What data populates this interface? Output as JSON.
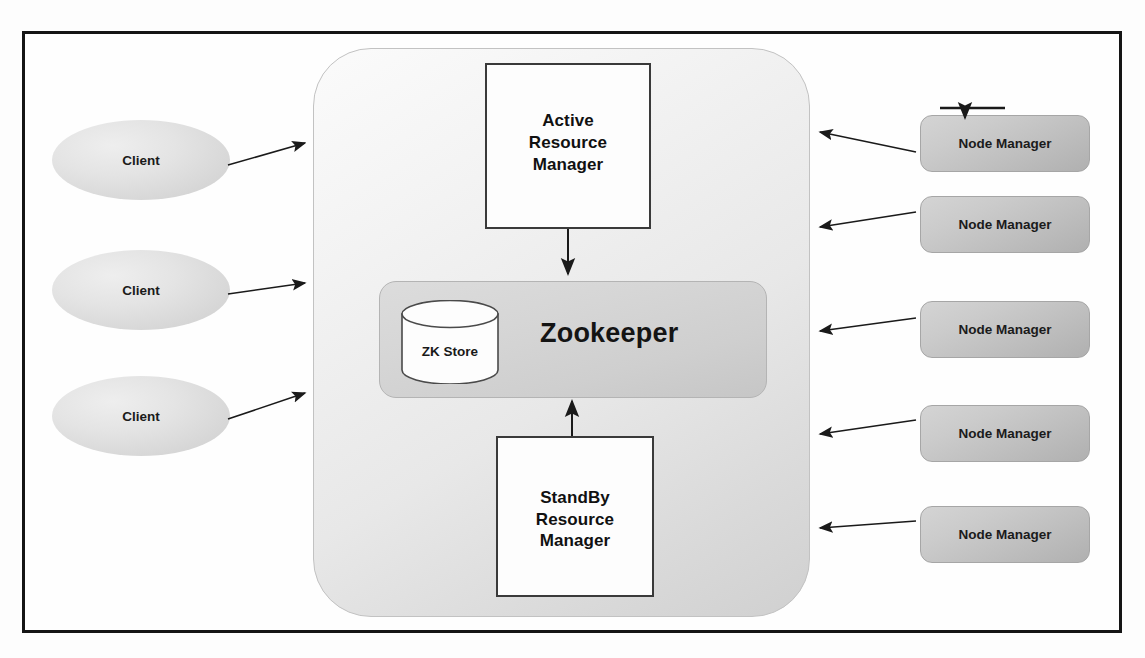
{
  "diagram": {
    "type": "architecture-diagram",
    "colors": {
      "frame_border": "#151515",
      "cluster_fill": "#e8e8e8",
      "zookeeper_fill": "#d4d4d4",
      "node_manager_fill": "#c4c4c4",
      "client_fill": "#dcdcdc",
      "rm_fill": "#fdfdfd",
      "arrow": "#1a1a1a",
      "text": "#111111"
    }
  },
  "clients": [
    {
      "label": "Client"
    },
    {
      "label": "Client"
    },
    {
      "label": "Client"
    }
  ],
  "cluster": {
    "active_rm": {
      "label": "Active\nResource\nManager",
      "lines": [
        "Active",
        "Resource",
        "Manager"
      ]
    },
    "standby_rm": {
      "label": "StandBy\nResource\nManager",
      "lines": [
        "StandBy",
        "Resource",
        "Manager"
      ]
    },
    "zookeeper": {
      "label": "Zookeeper",
      "store_label": "ZK Store"
    }
  },
  "node_managers": [
    {
      "label": "Node Manager"
    },
    {
      "label": "Node Manager"
    },
    {
      "label": "Node Manager"
    },
    {
      "label": "Node Manager"
    },
    {
      "label": "Node Manager"
    }
  ],
  "connections": [
    {
      "from": "Client 1",
      "to": "Cluster",
      "direction": "right"
    },
    {
      "from": "Client 2",
      "to": "Cluster",
      "direction": "right"
    },
    {
      "from": "Client 3",
      "to": "Cluster",
      "direction": "right"
    },
    {
      "from": "Active Resource Manager",
      "to": "Zookeeper",
      "direction": "down"
    },
    {
      "from": "StandBy Resource Manager",
      "to": "Zookeeper",
      "direction": "up"
    },
    {
      "from": "Node Manager 1",
      "to": "Cluster",
      "direction": "left"
    },
    {
      "from": "Node Manager 2",
      "to": "Cluster",
      "direction": "left"
    },
    {
      "from": "Node Manager 3",
      "to": "Cluster",
      "direction": "left"
    },
    {
      "from": "Node Manager 4",
      "to": "Cluster",
      "direction": "left"
    },
    {
      "from": "Node Manager 5",
      "to": "Cluster",
      "direction": "left"
    },
    {
      "from": "external",
      "to": "Node Manager 1",
      "direction": "down"
    }
  ]
}
